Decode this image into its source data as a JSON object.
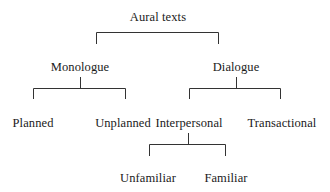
{
  "diagram": {
    "type": "tree",
    "title": "Aural texts",
    "colors": {
      "text": "#1a1a1a",
      "line": "#333333",
      "background": "#ffffff"
    },
    "nodes": {
      "root": "Aural texts",
      "monologue": "Monologue",
      "dialogue": "Dialogue",
      "planned": "Planned",
      "unplanned": "Unplanned",
      "interpersonal": "Interpersonal",
      "transactional": "Transactional",
      "unfamiliar": "Unfamiliar",
      "familiar": "Familiar"
    },
    "edges": [
      {
        "from": "Aural texts",
        "to": "Monologue"
      },
      {
        "from": "Aural texts",
        "to": "Dialogue"
      },
      {
        "from": "Monologue",
        "to": "Planned"
      },
      {
        "from": "Monologue",
        "to": "Unplanned"
      },
      {
        "from": "Dialogue",
        "to": "Interpersonal"
      },
      {
        "from": "Dialogue",
        "to": "Transactional"
      },
      {
        "from": "Interpersonal",
        "to": "Unfamiliar"
      },
      {
        "from": "Interpersonal",
        "to": "Familiar"
      }
    ]
  }
}
